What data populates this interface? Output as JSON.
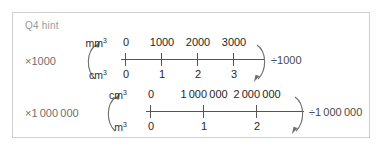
{
  "card": {
    "title": "Q4 hint",
    "border_color": "#cfcfcf",
    "title_color": "#9a9a9a",
    "background": "#ffffff"
  },
  "rows": [
    {
      "id": "mm-cm",
      "multiply_label": "×1000",
      "divide_label": "÷1000",
      "top_unit": "mm",
      "top_unit_exponent": "3",
      "bottom_unit": "cm",
      "bottom_unit_exponent": "3",
      "axis": {
        "left": 108,
        "width": 143,
        "color": "#555555"
      },
      "ticks": [
        {
          "x": 112,
          "top_label": "0",
          "bottom_label": "0"
        },
        {
          "x": 148,
          "top_label": "1000",
          "bottom_label": "1"
        },
        {
          "x": 184,
          "top_label": "2000",
          "bottom_label": "2"
        },
        {
          "x": 220,
          "top_label": "3000",
          "bottom_label": "3"
        }
      ]
    },
    {
      "id": "cm-m",
      "multiply_label": "×1 000 000",
      "divide_label": "÷1 000 000",
      "top_unit": "cm",
      "top_unit_exponent": "3",
      "bottom_unit": "m",
      "bottom_unit_exponent": "3",
      "axis": {
        "left": 133,
        "width": 158,
        "color": "#555555"
      },
      "ticks": [
        {
          "x": 137,
          "top_label": "0",
          "bottom_label": "0"
        },
        {
          "x": 190,
          "top_label": "1 000 000",
          "bottom_label": "1"
        },
        {
          "x": 243,
          "top_label": "2 000 000",
          "bottom_label": "2"
        }
      ]
    }
  ],
  "icons": {
    "arrow_open": "curved-arrow-up-left",
    "arrow_close": "curved-arrow-down-right"
  }
}
